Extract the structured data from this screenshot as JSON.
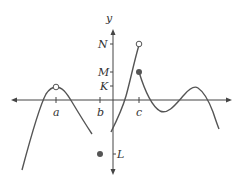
{
  "diagram": {
    "type": "function-graph",
    "axes": {
      "x_axis": {
        "y": 100,
        "x_start": 12,
        "x_end": 231,
        "arrows": "both"
      },
      "y_axis": {
        "x": 113,
        "y_start": 30,
        "y_end": 174,
        "arrows": "both",
        "label": "y"
      }
    },
    "x_ticks": [
      {
        "label": "a",
        "x": 56
      },
      {
        "label": "b",
        "x": 100
      },
      {
        "label": "c",
        "x": 139
      }
    ],
    "y_ticks": [
      {
        "label": "N",
        "y": 44
      },
      {
        "label": "M",
        "y": 72
      },
      {
        "label": "K",
        "y": 86
      },
      {
        "label": "L",
        "y": 154
      }
    ],
    "points": [
      {
        "name": "open-point-at-a",
        "x": 56,
        "y": 87,
        "filled": false
      },
      {
        "name": "open-point-at-c-N",
        "x": 139,
        "y": 44,
        "filled": false
      },
      {
        "name": "filled-point-at-c-M",
        "x": 139,
        "y": 72,
        "filled": true
      },
      {
        "name": "filled-point-at-b-L",
        "x": 100,
        "y": 154,
        "filled": true
      }
    ],
    "colors": {
      "axis": "#444444",
      "curve": "#555555",
      "dot": "#555555"
    }
  }
}
